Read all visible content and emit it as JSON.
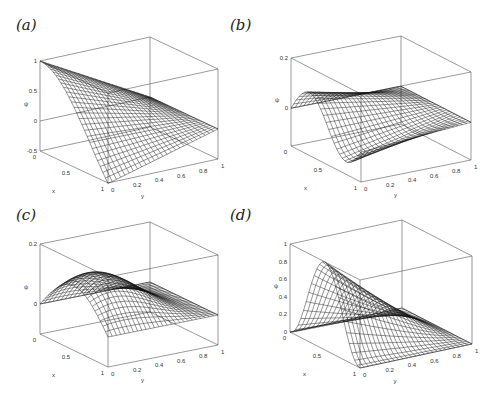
{
  "figure": {
    "panels": [
      {
        "id": "a",
        "label": "(a)"
      },
      {
        "id": "b",
        "label": "(b)"
      },
      {
        "id": "c",
        "label": "(c)"
      },
      {
        "id": "d",
        "label": "(d)"
      }
    ]
  },
  "chart_data": [
    {
      "type": "surface",
      "panel": "(a)",
      "xlabel": "x",
      "ylabel": "y",
      "zlabel": "ψ",
      "x_ticks": [
        "0",
        "0.5",
        "1"
      ],
      "y_ticks": [
        "0",
        "0.2",
        "0.4",
        "0.6",
        "0.8",
        "1"
      ],
      "z_ticks": [
        "-0.5",
        "0",
        "0.5",
        "1"
      ],
      "xlim": [
        0,
        1
      ],
      "ylim": [
        0,
        1
      ],
      "zlim": [
        -0.5,
        1
      ],
      "description": "Wireframe surface; ψ=1 at (x=0,y=0), decreasing to about -0.5 at (x=1,y=0), and 0 along y=1 edge",
      "function_hint": "cos(pi*x/ ... ) * (1-y) shape"
    },
    {
      "type": "surface",
      "panel": "(b)",
      "xlabel": "x",
      "ylabel": "y",
      "zlabel": "ψ",
      "x_ticks": [
        "0",
        "0.5",
        "1"
      ],
      "y_ticks": [
        "0",
        "0.2",
        "0.4",
        "0.6",
        "0.8",
        "1"
      ],
      "z_ticks": [
        "0",
        "0.2"
      ],
      "xlim": [
        0,
        1
      ],
      "ylim": [
        0,
        1
      ],
      "zlim": [
        -0.1,
        0.2
      ],
      "description": "Wireframe surface; positive hump near x≈0.2 (peak ≈0.1), crossing zero, negative trough toward x=1, decaying to 0 at y=1"
    },
    {
      "type": "surface",
      "panel": "(c)",
      "xlabel": "x",
      "ylabel": "y",
      "zlabel": "ψ",
      "x_ticks": [
        "0",
        "0.5",
        "1"
      ],
      "y_ticks": [
        "0",
        "0.2",
        "0.4",
        "0.6",
        "0.8",
        "1"
      ],
      "z_ticks": [
        "0",
        "0.2"
      ],
      "xlim": [
        0,
        1
      ],
      "ylim": [
        0,
        1
      ],
      "zlim": [
        -0.05,
        0.2
      ],
      "description": "Wireframe surface; single broad positive hump peaking ≈0.15 near x≈0.5, y≈0.2, zero at boundaries"
    },
    {
      "type": "surface",
      "panel": "(d)",
      "xlabel": "x",
      "ylabel": "y",
      "zlabel": "ψ",
      "x_ticks": [
        "0",
        "0.5",
        "1"
      ],
      "y_ticks": [
        "0",
        "0.2",
        "0.4",
        "0.6",
        "0.8",
        "1"
      ],
      "z_ticks": [
        "0",
        "0.2",
        "0.4",
        "0.6",
        "0.8",
        "1"
      ],
      "xlim": [
        0,
        1
      ],
      "ylim": [
        0,
        1
      ],
      "zlim": [
        0,
        1
      ],
      "description": "Wireframe surface; bell-shaped peak of ψ≈1 near x≈0.5, y=0, decaying to 0 at x=0, x=1 and y=1"
    }
  ]
}
